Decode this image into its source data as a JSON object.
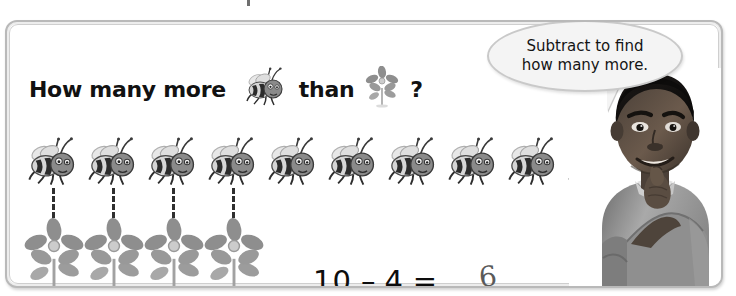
{
  "worksheet": {
    "question": {
      "prefix": "How many more",
      "middle": "than",
      "suffix": "?",
      "subject_icon": "bee-icon",
      "compare_icon": "flower-icon"
    },
    "speech_bubble": {
      "line1": "Subtract to find",
      "line2": "how many more.",
      "speaker": "student-photo"
    },
    "counters": {
      "bee_label": "bee",
      "bee_count": 10,
      "flower_label": "flower",
      "flower_count": 4,
      "connector_count": 4
    },
    "equation": {
      "minuend": "10",
      "minus_sign": "–",
      "subtrahend": "4",
      "equals_sign": "=",
      "answer": "6"
    },
    "colors": {
      "frame_border": "#b9b9b9",
      "page_background": "#ffffff",
      "bubble_fill": "#f4f4f4",
      "bee_body_dark": "#2b2b2b",
      "bee_body_light": "#d8d8d8",
      "flower_petal": "#8e8e8e",
      "connector": "#2f2f2f",
      "answer_ink": "#5a5a5a"
    }
  }
}
